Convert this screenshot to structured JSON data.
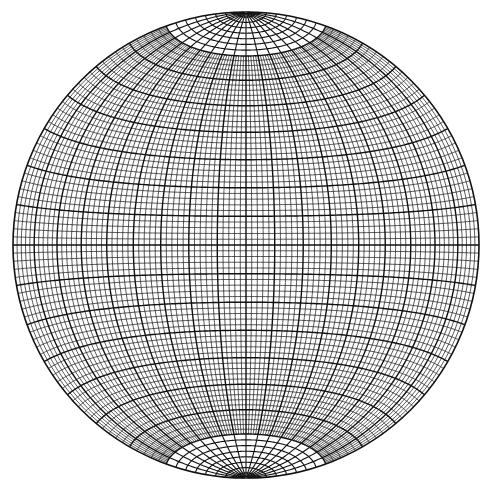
{
  "diagram": {
    "type": "equal-area stereonet (Schmidt net)",
    "projection": "lambert-azimuthal-equal-area",
    "aspect": "equatorial",
    "center": [
      246,
      245
    ],
    "radius": 233,
    "grid": {
      "minor_interval_deg": 2,
      "major_interval_deg": 10,
      "cap_start_lat_deg": 70,
      "cap_meridian_interval_deg": 10,
      "cap_parallel_interval_deg": 2.5
    },
    "colors": {
      "background": "#ffffff",
      "line": "#111111"
    },
    "stroke": {
      "minor": 0.7,
      "major": 1.4,
      "outline": 1.6
    }
  }
}
